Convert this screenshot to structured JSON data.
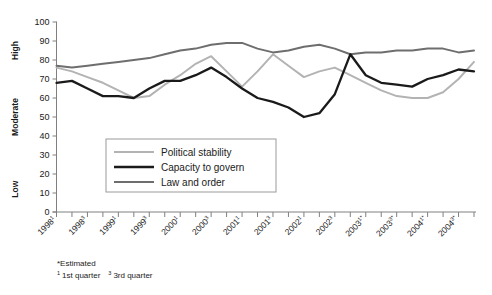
{
  "chart_data": {
    "type": "line",
    "title": "",
    "xlabel": "",
    "ylabel": "",
    "ylim": [
      0,
      100
    ],
    "ytick_step": 10,
    "grid": false,
    "legend_position": "inside-bottom-left",
    "y_category_labels": [
      {
        "text": "High",
        "value": 85
      },
      {
        "text": "Moderate",
        "value": 50
      },
      {
        "text": "Low",
        "value": 12
      }
    ],
    "yticks": [
      0,
      10,
      20,
      30,
      40,
      50,
      60,
      70,
      80,
      90,
      100
    ],
    "x": [
      "1998¹",
      "1998²",
      "1998³",
      "1998⁴",
      "1999¹",
      "1999²",
      "1999³",
      "1999⁴",
      "2000¹",
      "2000²",
      "2000³",
      "2000⁴",
      "2001¹",
      "2001²",
      "2001³",
      "2001⁴",
      "2002¹",
      "2002²",
      "2002³",
      "2002⁴",
      "2003¹*",
      "2003²*",
      "2003³*",
      "2003⁴*",
      "2004¹*",
      "2004²*",
      "2004³*",
      "2004⁴*"
    ],
    "xtick_labels": [
      {
        "index": 0,
        "year": "1998",
        "quarter": "1",
        "estimated": false
      },
      {
        "index": 2,
        "year": "1998",
        "quarter": "3",
        "estimated": false
      },
      {
        "index": 4,
        "year": "1999",
        "quarter": "1",
        "estimated": false
      },
      {
        "index": 6,
        "year": "1999",
        "quarter": "3",
        "estimated": false
      },
      {
        "index": 8,
        "year": "2000",
        "quarter": "1",
        "estimated": false
      },
      {
        "index": 10,
        "year": "2000",
        "quarter": "3",
        "estimated": false
      },
      {
        "index": 12,
        "year": "2001",
        "quarter": "1",
        "estimated": false
      },
      {
        "index": 14,
        "year": "2001",
        "quarter": "3",
        "estimated": false
      },
      {
        "index": 16,
        "year": "2002",
        "quarter": "1",
        "estimated": false
      },
      {
        "index": 18,
        "year": "2002",
        "quarter": "3",
        "estimated": false
      },
      {
        "index": 20,
        "year": "2003",
        "quarter": "1",
        "estimated": true
      },
      {
        "index": 22,
        "year": "2003",
        "quarter": "3",
        "estimated": true
      },
      {
        "index": 24,
        "year": "2004",
        "quarter": "1",
        "estimated": true
      },
      {
        "index": 26,
        "year": "2004",
        "quarter": "3",
        "estimated": true
      }
    ],
    "series": [
      {
        "name": "Political stability",
        "color": "#b3b3b3",
        "values": [
          76,
          74,
          71,
          68,
          64,
          60,
          61,
          67,
          72,
          78,
          82,
          74,
          66,
          74,
          83,
          77,
          71,
          74,
          76,
          72,
          68,
          64,
          61,
          60,
          60,
          63,
          70,
          79
        ]
      },
      {
        "name": "Capacity to govern",
        "color": "#1a1a1a",
        "values": [
          68,
          69,
          65,
          61,
          61,
          60,
          65,
          69,
          69,
          72,
          76,
          71,
          65,
          60,
          58,
          55,
          50,
          52,
          62,
          83,
          72,
          68,
          67,
          66,
          70,
          72,
          75,
          74
        ]
      },
      {
        "name": "Law and order",
        "color": "#6e6e6e",
        "values": [
          77,
          76,
          77,
          78,
          79,
          80,
          81,
          83,
          85,
          86,
          88,
          89,
          89,
          86,
          84,
          85,
          87,
          88,
          86,
          83,
          84,
          84,
          85,
          85,
          86,
          86,
          84,
          85
        ]
      }
    ]
  },
  "legend": {
    "items": [
      {
        "label": "Political stability",
        "color": "#b3b3b3"
      },
      {
        "label": "Capacity to govern",
        "color": "#1a1a1a"
      },
      {
        "label": "Law and order",
        "color": "#6e6e6e"
      }
    ]
  },
  "footnotes": {
    "estimated": "*Estimated",
    "q1_marker": "1",
    "q1_text": "1st quarter",
    "q3_marker": "3",
    "q3_text": "3rd quarter"
  }
}
